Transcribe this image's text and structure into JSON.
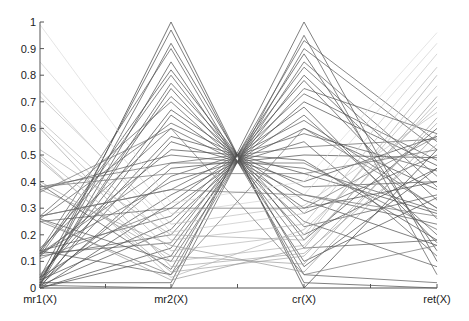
{
  "chart_data": {
    "type": "parallel_coordinates",
    "title": "",
    "axes": [
      "mr1(X)",
      "mr2(X)",
      "cr(X)",
      "ret(X)"
    ],
    "ylim": [
      0,
      1
    ],
    "yticks": [
      0,
      0.1,
      0.2,
      0.3,
      0.4,
      0.5,
      0.6,
      0.7,
      0.8,
      0.9,
      1
    ],
    "ytick_labels": [
      "0",
      "0.1",
      "0.2",
      "0.3",
      "0.4",
      "0.5",
      "0.6",
      "0.7",
      "0.8",
      "0.9",
      "1"
    ],
    "grid": false,
    "line_color": "#333333",
    "series": [
      {
        "values": [
          0.01,
          1.0,
          0.0,
          0.52
        ],
        "shade": 0.25
      },
      {
        "values": [
          0.02,
          0.92,
          0.08,
          0.45
        ],
        "shade": 0.3
      },
      {
        "values": [
          0.13,
          0.82,
          0.18,
          0.6
        ],
        "shade": 0.3
      },
      {
        "values": [
          0.03,
          0.77,
          0.23,
          0.35
        ],
        "shade": 0.35
      },
      {
        "values": [
          0.14,
          0.72,
          0.28,
          0.5
        ],
        "shade": 0.35
      },
      {
        "values": [
          0.04,
          0.67,
          0.33,
          0.16
        ],
        "shade": 0.3
      },
      {
        "values": [
          0.26,
          0.62,
          0.38,
          0.4
        ],
        "shade": 0.35
      },
      {
        "values": [
          0.05,
          0.57,
          0.43,
          0.28
        ],
        "shade": 0.3
      },
      {
        "values": [
          0.12,
          0.52,
          0.48,
          0.18
        ],
        "shade": 0.3
      },
      {
        "values": [
          0.38,
          0.47,
          0.53,
          0.56
        ],
        "shade": 0.4
      },
      {
        "values": [
          0.02,
          0.42,
          0.58,
          0.44
        ],
        "shade": 0.35
      },
      {
        "values": [
          0.27,
          0.37,
          0.63,
          0.3
        ],
        "shade": 0.35
      },
      {
        "values": [
          0.0,
          0.32,
          0.68,
          0.17
        ],
        "shade": 0.3
      },
      {
        "values": [
          0.14,
          0.27,
          0.73,
          0.48
        ],
        "shade": 0.35
      },
      {
        "values": [
          0.01,
          0.22,
          0.78,
          0.26
        ],
        "shade": 0.3
      },
      {
        "values": [
          0.13,
          0.17,
          0.83,
          0.38
        ],
        "shade": 0.35
      },
      {
        "values": [
          0.0,
          0.12,
          0.88,
          0.14
        ],
        "shade": 0.3
      },
      {
        "values": [
          0.39,
          0.07,
          0.93,
          0.55
        ],
        "shade": 0.35
      },
      {
        "values": [
          0.02,
          0.02,
          1.0,
          0.1
        ],
        "shade": 0.3
      },
      {
        "values": [
          0.01,
          0.0,
          0.95,
          0.05
        ],
        "shade": 0.35
      },
      {
        "values": [
          0.14,
          0.05,
          0.9,
          0.52
        ],
        "shade": 0.35
      },
      {
        "values": [
          0.26,
          0.1,
          0.85,
          0.42
        ],
        "shade": 0.35
      },
      {
        "values": [
          0.0,
          0.15,
          0.8,
          0.33
        ],
        "shade": 0.3
      },
      {
        "values": [
          0.12,
          0.2,
          0.75,
          0.58
        ],
        "shade": 0.35
      },
      {
        "values": [
          0.03,
          0.25,
          0.7,
          0.46
        ],
        "shade": 0.3
      },
      {
        "values": [
          0.25,
          0.3,
          0.65,
          0.2
        ],
        "shade": 0.35
      },
      {
        "values": [
          0.04,
          0.35,
          0.6,
          0.37
        ],
        "shade": 0.3
      },
      {
        "values": [
          0.13,
          0.4,
          0.55,
          0.12
        ],
        "shade": 0.35
      },
      {
        "values": [
          0.01,
          0.45,
          0.5,
          0.49
        ],
        "shade": 0.3
      },
      {
        "values": [
          0.37,
          0.5,
          0.45,
          0.29
        ],
        "shade": 0.35
      },
      {
        "values": [
          0.02,
          0.55,
          0.4,
          0.57
        ],
        "shade": 0.3
      },
      {
        "values": [
          0.15,
          0.6,
          0.35,
          0.24
        ],
        "shade": 0.35
      },
      {
        "values": [
          0.0,
          0.65,
          0.3,
          0.4
        ],
        "shade": 0.3
      },
      {
        "values": [
          0.27,
          0.7,
          0.25,
          0.08
        ],
        "shade": 0.35
      },
      {
        "values": [
          0.03,
          0.75,
          0.2,
          0.45
        ],
        "shade": 0.3
      },
      {
        "values": [
          0.12,
          0.8,
          0.15,
          0.18
        ],
        "shade": 0.35
      },
      {
        "values": [
          0.01,
          0.85,
          0.1,
          0.34
        ],
        "shade": 0.3
      },
      {
        "values": [
          0.14,
          0.9,
          0.05,
          0.02
        ],
        "shade": 0.35
      },
      {
        "values": [
          0.04,
          0.97,
          0.02,
          0.0
        ],
        "shade": 0.3
      },
      {
        "values": [
          0.48,
          0.06,
          0.12,
          0.62
        ],
        "shade": 0.65
      },
      {
        "values": [
          0.5,
          0.1,
          0.16,
          0.7
        ],
        "shade": 0.7
      },
      {
        "values": [
          0.61,
          0.14,
          0.2,
          0.76
        ],
        "shade": 0.72
      },
      {
        "values": [
          0.63,
          0.18,
          0.24,
          0.83
        ],
        "shade": 0.72
      },
      {
        "values": [
          0.74,
          0.21,
          0.28,
          0.88
        ],
        "shade": 0.78
      },
      {
        "values": [
          0.72,
          0.24,
          0.31,
          0.66
        ],
        "shade": 0.75
      },
      {
        "values": [
          0.85,
          0.28,
          0.35,
          0.92
        ],
        "shade": 0.82
      },
      {
        "values": [
          0.99,
          0.32,
          0.4,
          0.96
        ],
        "shade": 0.86
      },
      {
        "values": [
          0.6,
          0.08,
          0.13,
          0.54
        ],
        "shade": 0.65
      },
      {
        "values": [
          0.4,
          0.12,
          0.09,
          0.64
        ],
        "shade": 0.62
      },
      {
        "values": [
          0.37,
          0.16,
          0.06,
          0.58
        ],
        "shade": 0.6
      },
      {
        "values": [
          0.26,
          0.03,
          0.15,
          0.72
        ],
        "shade": 0.6
      },
      {
        "values": [
          0.52,
          0.2,
          0.18,
          0.8
        ],
        "shade": 0.68
      },
      {
        "values": [
          0.49,
          0.04,
          0.22,
          0.68
        ],
        "shade": 0.7
      },
      {
        "values": [
          0.27,
          0.37,
          0.35,
          0.27
        ],
        "shade": 0.45
      },
      {
        "values": [
          0.38,
          0.43,
          0.43,
          0.52
        ],
        "shade": 0.45
      },
      {
        "values": [
          0.13,
          0.47,
          0.47,
          0.22
        ],
        "shade": 0.4
      },
      {
        "values": [
          0.11,
          0.3,
          0.3,
          0.57
        ],
        "shade": 0.45
      },
      {
        "values": [
          0.25,
          0.05,
          0.6,
          0.3
        ],
        "shade": 0.45
      },
      {
        "values": [
          0.36,
          0.6,
          0.05,
          0.16
        ],
        "shade": 0.45
      }
    ]
  },
  "plot": {
    "x_axis_positions": [
      40,
      171,
      304,
      437
    ],
    "y_top": 22,
    "y_bottom": 288
  }
}
